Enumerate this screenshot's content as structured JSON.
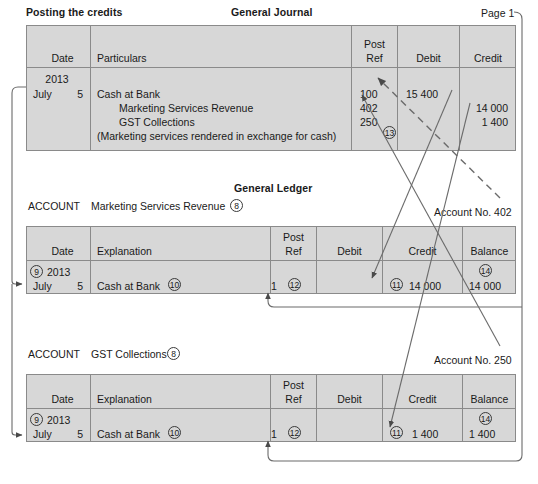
{
  "page": {
    "caption": "Posting the credits",
    "journal_title": "General Journal",
    "page_label": "Page 1",
    "ledger_title": "General Ledger"
  },
  "journal": {
    "headers": [
      "Date",
      "Particulars",
      "Post Ref",
      "Debit",
      "Credit"
    ],
    "header_post": "Post",
    "header_ref": "Ref",
    "year": "2013",
    "month": "July",
    "day": "5",
    "lines": [
      {
        "particulars": "Cash at Bank",
        "post_ref": "100",
        "debit": "15 400",
        "credit": ""
      },
      {
        "particulars": "Marketing Services Revenue",
        "post_ref": "402",
        "debit": "",
        "credit": "14 000"
      },
      {
        "particulars": "GST Collections",
        "post_ref": "250",
        "debit": "",
        "credit": "1 400"
      },
      {
        "particulars": "(Marketing services rendered in exchange for cash)",
        "post_ref": "",
        "debit": "",
        "credit": ""
      }
    ],
    "marker_13": "13"
  },
  "ledgers": [
    {
      "account_word": "ACCOUNT",
      "account_name": "Marketing Services Revenue",
      "account_name_marker": "8",
      "account_no_label": "Account No. 402",
      "headers": [
        "Date",
        "Explanation",
        "Post Ref",
        "Debit",
        "Credit",
        "Balance"
      ],
      "header_post": "Post",
      "header_ref": "Ref",
      "date_marker": "9",
      "year": "2013",
      "month": "July",
      "day": "5",
      "explanation": "Cash at Bank",
      "explanation_marker": "10",
      "post_ref": "1",
      "post_ref_marker": "12",
      "credit_marker": "11",
      "credit": "14 000",
      "balance_marker": "14",
      "balance": "14 000",
      "debit": ""
    },
    {
      "account_word": "ACCOUNT",
      "account_name": "GST Collections",
      "account_name_marker": "8",
      "account_no_label": "Account No. 250",
      "headers": [
        "Date",
        "Explanation",
        "Post Ref",
        "Debit",
        "Credit",
        "Balance"
      ],
      "header_post": "Post",
      "header_ref": "Ref",
      "date_marker": "9",
      "year": "2013",
      "month": "July",
      "day": "5",
      "explanation": "Cash at Bank",
      "explanation_marker": "10",
      "post_ref": "1",
      "post_ref_marker": "12",
      "credit_marker": "11",
      "credit": "1 400",
      "balance_marker": "14",
      "balance": "1 400",
      "debit": ""
    }
  ],
  "colors": {
    "table_fill": "#d7d7d7",
    "rule": "#8a8a8a",
    "ink": "#1a1a1a",
    "connector": "#5a5a5a"
  }
}
